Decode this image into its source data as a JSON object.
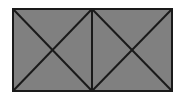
{
  "diagram": {
    "type": "two-boxes-with-diagonal-crosses",
    "background": "#ffffff",
    "fill": "#808080",
    "stroke": "#1a1a1a",
    "stroke_width": 2,
    "outer_rect": {
      "x": 13,
      "y": 9,
      "width": 159,
      "height": 82
    },
    "divider_x": 92,
    "cells": [
      {
        "name": "left-cell",
        "x1": 13,
        "y1": 9,
        "x2": 92,
        "y2": 91
      },
      {
        "name": "right-cell",
        "x1": 92,
        "y1": 9,
        "x2": 172,
        "y2": 91
      }
    ]
  }
}
